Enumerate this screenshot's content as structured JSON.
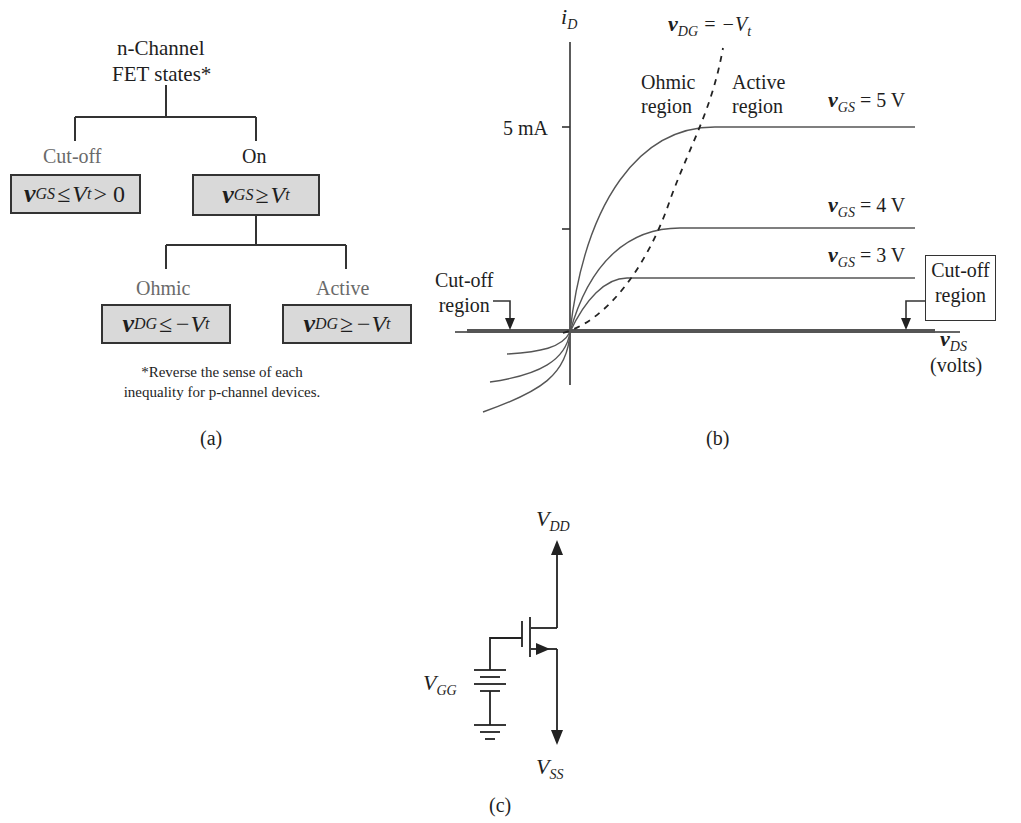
{
  "panel_a": {
    "root": {
      "line1": "n-Channel",
      "line2": "FET states*"
    },
    "cutoff": {
      "label": "Cut-off",
      "var": "v",
      "sub": "GS",
      "rel": "≤",
      "rhs": "V",
      "rhs_sub": "t",
      "tail": "> 0"
    },
    "on": {
      "label": "On",
      "var": "v",
      "sub": "GS",
      "rel": "≥",
      "rhs": "V",
      "rhs_sub": "t"
    },
    "ohmic": {
      "label": "Ohmic",
      "var": "v",
      "sub": "DG",
      "rel": "≤",
      "rhs": "−V",
      "rhs_sub": "t"
    },
    "active": {
      "label": "Active",
      "var": "v",
      "sub": "DG",
      "rel": "≥",
      "rhs": "−V",
      "rhs_sub": "t"
    },
    "footnote_line1": "*Reverse the sense of each",
    "footnote_line2": "inequality for p-channel devices.",
    "caption": "(a)"
  },
  "panel_b": {
    "y_axis_var": "i",
    "y_axis_sub": "D",
    "x_axis_var": "v",
    "x_axis_sub": "DS",
    "x_axis_unit": "(volts)",
    "tick_label": "5 mA",
    "boundary": {
      "var": "v",
      "sub": "DG",
      "eq": "= −V",
      "eq_sub": "t"
    },
    "ohmic_region": {
      "line1": "Ohmic",
      "line2": "region"
    },
    "active_region": {
      "line1": "Active",
      "line2": "region"
    },
    "curves": [
      {
        "var": "v",
        "sub": "GS",
        "eq": "= 5 V"
      },
      {
        "var": "v",
        "sub": "GS",
        "eq": "= 4 V"
      },
      {
        "var": "v",
        "sub": "GS",
        "eq": "= 3 V"
      }
    ],
    "cutoff_left": {
      "line1": "Cut-off",
      "line2": "region"
    },
    "cutoff_right": {
      "line1": "Cut-off",
      "line2": "region"
    },
    "caption": "(b)"
  },
  "panel_c": {
    "vdd": {
      "var": "V",
      "sub": "DD"
    },
    "vgg": {
      "var": "V",
      "sub": "GG"
    },
    "vss": {
      "var": "V",
      "sub": "SS"
    },
    "caption": "(c)"
  }
}
